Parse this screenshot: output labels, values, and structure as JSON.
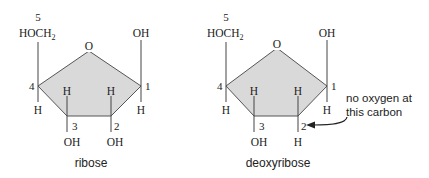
{
  "diagram": {
    "fill_color": "#d9d9d9",
    "line_color": "#444444",
    "molecules": [
      {
        "name": "ribose",
        "caption": "ribose",
        "ring_oxygen": "O",
        "carbon_numbers": {
          "c1": "1",
          "c2": "2",
          "c3": "3",
          "c4": "4",
          "c5": "5"
        },
        "substituents": {
          "c5_group": "HOCH",
          "c5_group_sub": "2",
          "c1_top": "OH",
          "c1_bottom": "H",
          "c4_bottom": "H",
          "c3_top": "H",
          "c3_bottom": "OH",
          "c2_top": "H",
          "c2_bottom": "OH"
        }
      },
      {
        "name": "deoxyribose",
        "caption": "deoxyribose",
        "ring_oxygen": "O",
        "carbon_numbers": {
          "c1": "1",
          "c2": "2",
          "c3": "3",
          "c4": "4",
          "c5": "5"
        },
        "substituents": {
          "c5_group": "HOCH",
          "c5_group_sub": "2",
          "c1_top": "OH",
          "c1_bottom": "H",
          "c4_bottom": "H",
          "c3_top": "H",
          "c3_bottom": "OH",
          "c2_top": "H",
          "c2_bottom": "H"
        },
        "annotation": {
          "line1": "no oxygen at",
          "line2": "this carbon"
        }
      }
    ]
  }
}
